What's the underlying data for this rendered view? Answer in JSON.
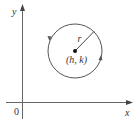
{
  "diagram": {
    "type": "circle-on-coordinate-plane",
    "axes": {
      "x_label": "x",
      "y_label": "y",
      "origin_label": "0"
    },
    "circle": {
      "center_label": "(h, k)",
      "radius_label": "r",
      "orientation": "counterclockwise"
    },
    "colors": {
      "stroke": "#555555",
      "text": "#333333",
      "background": "#ffffff"
    }
  }
}
